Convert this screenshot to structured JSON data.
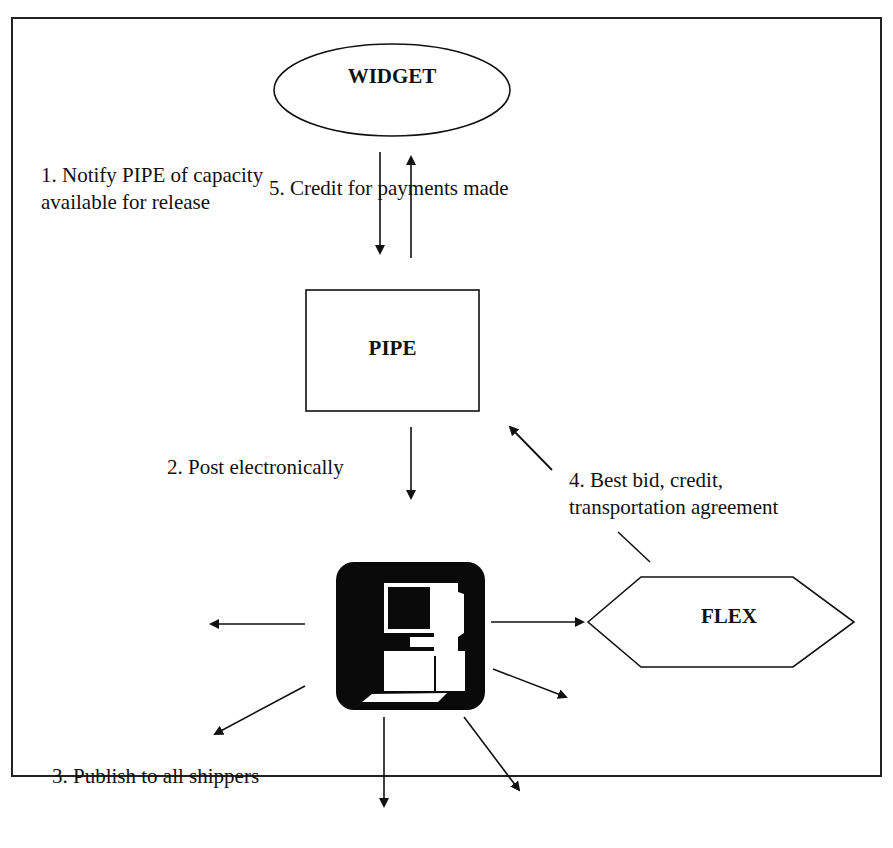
{
  "nodes": {
    "widget": {
      "label": "WIDGET",
      "shape": "ellipse"
    },
    "pipe": {
      "label": "PIPE",
      "shape": "rectangle"
    },
    "computer": {
      "label": "",
      "shape": "computer-icon"
    },
    "flex": {
      "label": "FLEX",
      "shape": "hexagon"
    }
  },
  "steps": {
    "step1": {
      "line1": "1.  Notify PIPE of capacity",
      "line2": "available for release"
    },
    "step2": {
      "label": "2.  Post electronically"
    },
    "step3": {
      "label": "3.  Publish to all shippers"
    },
    "step4": {
      "line1": "4.  Best bid, credit,",
      "line2": "transportation agreement"
    },
    "step5": {
      "label": "5.  Credit for payments made"
    }
  },
  "colors": {
    "stroke": "#111111",
    "background": "#ffffff",
    "icon_fill": "#0a0a0a"
  }
}
